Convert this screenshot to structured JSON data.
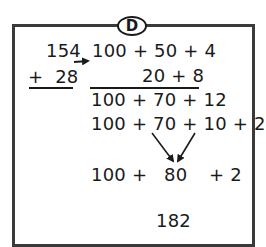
{
  "label": "D",
  "left_column": {
    "addend_1": "154",
    "addend_2": "+  28"
  },
  "expanded": {
    "row_1": "100 + 50 + 4",
    "row_2": "20 + 8",
    "row_3": "100 + 70 + 12",
    "row_4": "100 + 70 + 10 + 2",
    "row_5": {
      "part_1": "100 +",
      "part_2": "80",
      "part_3": "+ 2"
    },
    "result": "182"
  },
  "colors": {
    "border": "#3a3a3a",
    "ink": "#1a1a1a",
    "background": "#ffffff"
  }
}
